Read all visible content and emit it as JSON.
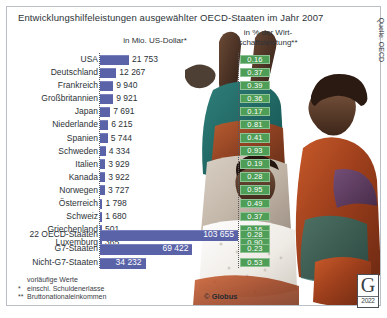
{
  "title": "Entwicklungshilfeleistungen ausgewählter OECD-Staaten im Jahr 2007",
  "headers": {
    "money": "in Mio. US-Dollar*",
    "percent_line1": "in % der Wirt-",
    "percent_line2": "schaftsleistung**"
  },
  "colors": {
    "bar": "#5a63a8",
    "pct_badge": "#4f9e57",
    "text": "#2d3338"
  },
  "chart_data": {
    "type": "bar",
    "title": "Entwicklungshilfeleistungen ausgewählter OECD-Staaten im Jahr 2007",
    "xlabel": "in Mio. US-Dollar*",
    "ylabel": "",
    "categories": [
      "USA",
      "Deutschland",
      "Frankreich",
      "Großbritannien",
      "Japan",
      "Niederlande",
      "Spanien",
      "Schweden",
      "Italien",
      "Kanada",
      "Norwegen",
      "Österreich",
      "Schweiz",
      "Griechenland",
      "Luxemburg"
    ],
    "values": [
      21753,
      12267,
      9940,
      9921,
      7691,
      6215,
      5744,
      4334,
      3929,
      3922,
      3727,
      1798,
      1680,
      501,
      365
    ],
    "series": [
      {
        "name": "in Mio. US-Dollar",
        "values": [
          21753,
          12267,
          9940,
          9921,
          7691,
          6215,
          5744,
          4334,
          3929,
          3922,
          3727,
          1798,
          1680,
          501,
          365
        ]
      },
      {
        "name": "in % der Wirtschaftsleistung",
        "values": [
          0.16,
          0.37,
          0.39,
          0.36,
          0.17,
          0.81,
          0.41,
          0.93,
          0.19,
          0.28,
          0.95,
          0.49,
          0.37,
          0.16,
          0.9
        ]
      }
    ],
    "aggregates": {
      "categories": [
        "22 OECD-Staaten",
        "G7-Staaten",
        "Nicht-G7-Staaten"
      ],
      "values": [
        103655,
        69422,
        34232
      ],
      "percents": [
        0.28,
        0.23,
        0.53
      ]
    },
    "xlim": [
      0,
      103655
    ],
    "grid": false,
    "legend": "none"
  },
  "rows": [
    {
      "label": "USA",
      "value": "21 753",
      "num": 21753,
      "pct": "0.16"
    },
    {
      "label": "Deutschland",
      "value": "12 267",
      "num": 12267,
      "pct": "0.37"
    },
    {
      "label": "Frankreich",
      "value": "9 940",
      "num": 9940,
      "pct": "0.39"
    },
    {
      "label": "Großbritannien",
      "value": "9 921",
      "num": 9921,
      "pct": "0.36"
    },
    {
      "label": "Japan",
      "value": "7 691",
      "num": 7691,
      "pct": "0.17"
    },
    {
      "label": "Niederlande",
      "value": "6 215",
      "num": 6215,
      "pct": "0.81"
    },
    {
      "label": "Spanien",
      "value": "5 744",
      "num": 5744,
      "pct": "0.41"
    },
    {
      "label": "Schweden",
      "value": "4 334",
      "num": 4334,
      "pct": "0.93"
    },
    {
      "label": "Italien",
      "value": "3 929",
      "num": 3929,
      "pct": "0.19"
    },
    {
      "label": "Kanada",
      "value": "3 922",
      "num": 3922,
      "pct": "0.28"
    },
    {
      "label": "Norwegen",
      "value": "3 727",
      "num": 3727,
      "pct": "0.95"
    },
    {
      "label": "Österreich",
      "value": "1 798",
      "num": 1798,
      "pct": "0.49"
    },
    {
      "label": "Schweiz",
      "value": "1 680",
      "num": 1680,
      "pct": "0.37"
    },
    {
      "label": "Griechenland",
      "value": "501",
      "num": 501,
      "pct": "0.16"
    },
    {
      "label": "Luxemburg",
      "value": "365",
      "num": 365,
      "pct": "0.90"
    }
  ],
  "aggregates": [
    {
      "label": "22 OECD-Staaten",
      "value": "103 655",
      "num": 103655,
      "pct": "0.28"
    },
    {
      "label": "G7-Staaten",
      "value": "69 422",
      "num": 69422,
      "pct": "0.23"
    },
    {
      "label": "Nicht-G7-Staaten",
      "value": "34 232",
      "num": 34232,
      "pct": "0.53"
    }
  ],
  "footnotes": [
    {
      "mark": "",
      "text": "vorläufige Werte"
    },
    {
      "mark": "*",
      "text": "einschl. Schuldenerlasse"
    },
    {
      "mark": "**",
      "text": "Bruttonationaleinkommen"
    }
  ],
  "copyright": {
    "symbol": "©",
    "name": "Globus"
  },
  "logo": {
    "letter": "G",
    "year": "2022"
  },
  "source": "Quelle: OECD"
}
